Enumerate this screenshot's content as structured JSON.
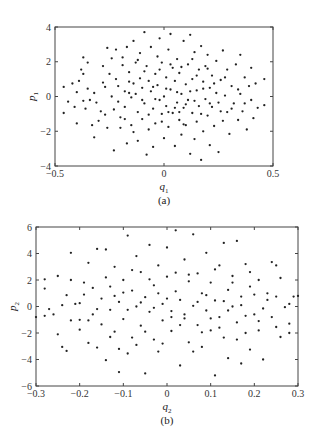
{
  "chart_data": [
    {
      "type": "scatter",
      "panel": "(a)",
      "caption": "(a)",
      "xlabel": "q",
      "xlabel_sub": "1",
      "ylabel": "p",
      "ylabel_sub": "1",
      "xlim": [
        -0.5,
        0.5
      ],
      "ylim": [
        -4,
        4
      ],
      "xticks": [
        -0.5,
        0,
        0.5
      ],
      "xtick_labels": [
        "-0.5",
        "0",
        "0.5"
      ],
      "yticks": [
        -4,
        -2,
        0,
        2,
        4
      ],
      "ytick_labels": [
        "-4",
        "-2",
        "0",
        "2",
        "4"
      ],
      "grid": false,
      "frame": {
        "left": 55,
        "top": 27,
        "right": 273,
        "bottom": 166
      },
      "points": [
        [
          -0.46,
          0.55
        ],
        [
          -0.46,
          -0.95
        ],
        [
          -0.42,
          0.75
        ],
        [
          -0.41,
          -0.6
        ],
        [
          -0.4,
          0.25
        ],
        [
          -0.4,
          -1.55
        ],
        [
          -0.38,
          1.55
        ],
        [
          -0.37,
          2.25
        ],
        [
          -0.37,
          1.3
        ],
        [
          -0.37,
          -0.25
        ],
        [
          -0.36,
          -0.7
        ],
        [
          -0.35,
          1.95
        ],
        [
          -0.34,
          -0.2
        ],
        [
          -0.33,
          -1.65
        ],
        [
          -0.32,
          0.2
        ],
        [
          -0.32,
          -2.35
        ],
        [
          -0.3,
          -1.4
        ],
        [
          -0.29,
          -0.85
        ],
        [
          -0.28,
          1.75
        ],
        [
          -0.28,
          0.8
        ],
        [
          -0.27,
          0.55
        ],
        [
          -0.26,
          -1.8
        ],
        [
          -0.26,
          2.8
        ],
        [
          -0.25,
          1.3
        ],
        [
          -0.24,
          0.0
        ],
        [
          -0.23,
          -3.1
        ],
        [
          -0.23,
          -0.75
        ],
        [
          -0.22,
          2.7
        ],
        [
          -0.22,
          1.0
        ],
        [
          -0.21,
          0.6
        ],
        [
          -0.21,
          -0.3
        ],
        [
          -0.2,
          -1.2
        ],
        [
          -0.19,
          2.25
        ],
        [
          -0.19,
          1.8
        ],
        [
          -0.18,
          0.3
        ],
        [
          -0.18,
          -0.6
        ],
        [
          -0.17,
          -2.7
        ],
        [
          -0.17,
          2.85
        ],
        [
          -0.16,
          1.4
        ],
        [
          -0.16,
          0.85
        ],
        [
          -0.15,
          -1.65
        ],
        [
          -0.15,
          -0.05
        ],
        [
          -0.14,
          3.2
        ],
        [
          -0.14,
          -2.05
        ],
        [
          -0.13,
          1.95
        ],
        [
          -0.13,
          0.15
        ],
        [
          -0.12,
          -0.9
        ],
        [
          -0.12,
          -2.55
        ],
        [
          -0.11,
          2.5
        ],
        [
          -0.11,
          1.05
        ],
        [
          -0.1,
          0.5
        ],
        [
          -0.1,
          -1.3
        ],
        [
          -0.09,
          3.7
        ],
        [
          -0.09,
          -0.4
        ],
        [
          -0.08,
          -3.35
        ],
        [
          -0.08,
          1.75
        ],
        [
          -0.07,
          0.9
        ],
        [
          -0.07,
          -1.9
        ],
        [
          -0.06,
          2.85
        ],
        [
          -0.06,
          0.3
        ],
        [
          -0.05,
          -0.7
        ],
        [
          -0.05,
          -2.9
        ],
        [
          -0.04,
          1.3
        ],
        [
          -0.04,
          -1.55
        ],
        [
          -0.03,
          2.3
        ],
        [
          -0.03,
          0.65
        ],
        [
          -0.02,
          3.35
        ],
        [
          -0.02,
          -0.2
        ],
        [
          -0.01,
          -1.0
        ],
        [
          -0.01,
          1.95
        ],
        [
          0.0,
          0.0
        ],
        [
          0.0,
          -2.4
        ],
        [
          0.01,
          1.1
        ],
        [
          0.01,
          -0.55
        ],
        [
          0.02,
          2.7
        ],
        [
          0.02,
          -1.75
        ],
        [
          0.03,
          3.6
        ],
        [
          0.03,
          0.4
        ],
        [
          0.04,
          -0.95
        ],
        [
          0.04,
          1.65
        ],
        [
          0.05,
          -2.85
        ],
        [
          0.05,
          0.9
        ],
        [
          0.06,
          -0.35
        ],
        [
          0.06,
          2.15
        ],
        [
          0.07,
          -1.35
        ],
        [
          0.07,
          1.35
        ],
        [
          0.08,
          0.15
        ],
        [
          0.08,
          -2.2
        ],
        [
          0.09,
          3.2
        ],
        [
          0.09,
          -0.65
        ],
        [
          0.1,
          0.7
        ],
        [
          0.1,
          -1.65
        ],
        [
          0.11,
          1.85
        ],
        [
          0.11,
          -0.2
        ],
        [
          0.12,
          3.55
        ],
        [
          0.12,
          -3.3
        ],
        [
          0.13,
          -0.95
        ],
        [
          0.13,
          1.0
        ],
        [
          0.14,
          2.55
        ],
        [
          0.14,
          -2.45
        ],
        [
          0.15,
          0.35
        ],
        [
          0.15,
          -1.45
        ],
        [
          0.16,
          1.55
        ],
        [
          0.16,
          -0.55
        ],
        [
          0.17,
          2.9
        ],
        [
          0.17,
          -3.65
        ],
        [
          0.18,
          0.85
        ],
        [
          0.18,
          -2.0
        ],
        [
          0.19,
          -0.15
        ],
        [
          0.19,
          1.75
        ],
        [
          0.2,
          -1.1
        ],
        [
          0.2,
          2.4
        ],
        [
          0.21,
          0.5
        ],
        [
          0.21,
          -2.8
        ],
        [
          0.22,
          -0.6
        ],
        [
          0.22,
          1.2
        ],
        [
          0.23,
          -1.7
        ],
        [
          0.24,
          0.2
        ],
        [
          0.24,
          2.05
        ],
        [
          0.25,
          -0.35
        ],
        [
          0.25,
          -3.2
        ],
        [
          0.26,
          0.95
        ],
        [
          0.27,
          -1.4
        ],
        [
          0.27,
          2.65
        ],
        [
          0.28,
          0.05
        ],
        [
          0.29,
          -0.9
        ],
        [
          0.29,
          1.55
        ],
        [
          0.3,
          -2.15
        ],
        [
          0.31,
          0.6
        ],
        [
          0.32,
          -0.4
        ],
        [
          0.33,
          1.85
        ],
        [
          0.34,
          -1.35
        ],
        [
          0.35,
          2.4
        ],
        [
          0.35,
          0.15
        ],
        [
          0.36,
          -0.85
        ],
        [
          0.37,
          1.1
        ],
        [
          0.38,
          -1.9
        ],
        [
          0.39,
          0.6
        ],
        [
          0.4,
          -0.2
        ],
        [
          0.4,
          1.65
        ],
        [
          0.41,
          -1.25
        ],
        [
          0.42,
          0.75
        ],
        [
          0.43,
          -0.65
        ],
        [
          0.46,
          1.0
        ],
        [
          0.46,
          -0.5
        ],
        [
          -0.44,
          -0.3
        ],
        [
          -0.39,
          0.9
        ],
        [
          -0.35,
          0.45
        ],
        [
          -0.31,
          -0.35
        ],
        [
          -0.27,
          -1.05
        ],
        [
          -0.24,
          2.2
        ],
        [
          -0.2,
          -1.8
        ],
        [
          -0.18,
          -1.3
        ],
        [
          -0.16,
          0.2
        ],
        [
          -0.14,
          0.75
        ],
        [
          -0.12,
          2.1
        ],
        [
          -0.1,
          -0.2
        ],
        [
          -0.09,
          1.45
        ],
        [
          -0.07,
          -1.05
        ],
        [
          -0.05,
          0.55
        ],
        [
          -0.04,
          -0.15
        ],
        [
          -0.02,
          1.55
        ],
        [
          -0.01,
          -1.45
        ],
        [
          0.01,
          0.45
        ],
        [
          0.02,
          -0.9
        ],
        [
          0.03,
          1.85
        ],
        [
          0.05,
          -0.65
        ],
        [
          0.06,
          0.25
        ],
        [
          0.07,
          -0.9
        ],
        [
          0.08,
          1.7
        ],
        [
          0.09,
          -1.6
        ],
        [
          0.1,
          -0.45
        ],
        [
          0.12,
          0.3
        ],
        [
          0.13,
          2.15
        ],
        [
          0.14,
          -0.25
        ],
        [
          0.15,
          1.2
        ],
        [
          0.17,
          -1.0
        ],
        [
          0.18,
          0.45
        ],
        [
          0.2,
          1.6
        ],
        [
          0.21,
          -0.4
        ],
        [
          0.23,
          0.75
        ],
        [
          0.26,
          -0.85
        ],
        [
          0.28,
          1.1
        ],
        [
          0.31,
          -0.7
        ],
        [
          0.34,
          0.4
        ],
        [
          0.37,
          -0.4
        ]
      ]
    },
    {
      "type": "scatter",
      "panel": "(b)",
      "caption": "(b)",
      "xlabel": "q",
      "xlabel_sub": "2",
      "ylabel": "p",
      "ylabel_sub": "2",
      "xlim": [
        -0.3,
        0.3
      ],
      "ylim": [
        -6,
        6
      ],
      "xticks": [
        -0.3,
        -0.2,
        -0.1,
        0,
        0.1,
        0.2,
        0.3
      ],
      "xtick_labels": [
        "-0.3",
        "-0.2",
        "-0.1",
        "0",
        "0.1",
        "0.2",
        "0.3"
      ],
      "yticks": [
        -6,
        -4,
        -2,
        0,
        2,
        4,
        6
      ],
      "ytick_labels": [
        "-6",
        "-4",
        "-2",
        "0",
        "2",
        "4",
        "6"
      ],
      "grid": false,
      "frame": {
        "left": 36,
        "top": 227,
        "right": 298,
        "bottom": 386
      },
      "points": [
        [
          -0.3,
          -0.8
        ],
        [
          -0.28,
          2.05
        ],
        [
          -0.28,
          1.35
        ],
        [
          -0.28,
          -0.7
        ],
        [
          -0.27,
          -0.2
        ],
        [
          -0.25,
          2.3
        ],
        [
          -0.25,
          -2.1
        ],
        [
          -0.24,
          0.1
        ],
        [
          -0.24,
          -3.05
        ],
        [
          -0.23,
          0.85
        ],
        [
          -0.23,
          -3.35
        ],
        [
          -0.22,
          4.05
        ],
        [
          -0.22,
          2.0
        ],
        [
          -0.21,
          0.2
        ],
        [
          -0.2,
          -1.75
        ],
        [
          -0.2,
          -1.0
        ],
        [
          -0.19,
          1.8
        ],
        [
          -0.19,
          0.9
        ],
        [
          -0.18,
          3.3
        ],
        [
          -0.18,
          -2.75
        ],
        [
          -0.17,
          1.4
        ],
        [
          -0.17,
          -0.6
        ],
        [
          -0.16,
          4.35
        ],
        [
          -0.16,
          -3.1
        ],
        [
          -0.15,
          0.6
        ],
        [
          -0.15,
          -1.35
        ],
        [
          -0.14,
          4.3
        ],
        [
          -0.14,
          -4.05
        ],
        [
          -0.13,
          1.5
        ],
        [
          -0.13,
          -0.25
        ],
        [
          -0.12,
          3.0
        ],
        [
          -0.12,
          -1.9
        ],
        [
          -0.11,
          0.35
        ],
        [
          -0.11,
          -4.95
        ],
        [
          -0.1,
          2.0
        ],
        [
          -0.1,
          -0.95
        ],
        [
          -0.09,
          5.35
        ],
        [
          -0.09,
          -3.55
        ],
        [
          -0.08,
          1.2
        ],
        [
          -0.08,
          -2.35
        ],
        [
          -0.07,
          3.8
        ],
        [
          -0.07,
          0.0
        ],
        [
          -0.06,
          -1.45
        ],
        [
          -0.06,
          2.6
        ],
        [
          -0.05,
          -5.05
        ],
        [
          -0.05,
          0.7
        ],
        [
          -0.04,
          -0.4
        ],
        [
          -0.04,
          4.65
        ],
        [
          -0.03,
          1.6
        ],
        [
          -0.03,
          -2.5
        ],
        [
          -0.02,
          3.1
        ],
        [
          -0.02,
          -3.4
        ],
        [
          -0.01,
          0.2
        ],
        [
          -0.01,
          -1.05
        ],
        [
          0.0,
          2.25
        ],
        [
          0.0,
          4.45
        ],
        [
          0.01,
          -0.35
        ],
        [
          0.01,
          -1.85
        ],
        [
          0.02,
          1.15
        ],
        [
          0.02,
          5.75
        ],
        [
          0.03,
          -4.45
        ],
        [
          0.03,
          0.5
        ],
        [
          0.04,
          3.55
        ],
        [
          0.04,
          -0.9
        ],
        [
          0.05,
          1.9
        ],
        [
          0.05,
          -2.7
        ],
        [
          0.06,
          5.45
        ],
        [
          0.06,
          0.05
        ],
        [
          0.07,
          -1.4
        ],
        [
          0.07,
          2.5
        ],
        [
          0.08,
          -3.05
        ],
        [
          0.08,
          1.0
        ],
        [
          0.09,
          -0.3
        ],
        [
          0.09,
          4.05
        ],
        [
          0.1,
          -1.8
        ],
        [
          0.1,
          1.8
        ],
        [
          0.11,
          -5.2
        ],
        [
          0.11,
          0.45
        ],
        [
          0.12,
          3.1
        ],
        [
          0.12,
          -0.8
        ],
        [
          0.13,
          4.8
        ],
        [
          0.13,
          -2.35
        ],
        [
          0.14,
          1.25
        ],
        [
          0.14,
          -3.9
        ],
        [
          0.15,
          0.0
        ],
        [
          0.15,
          2.3
        ],
        [
          0.16,
          -1.2
        ],
        [
          0.16,
          4.95
        ],
        [
          0.17,
          0.75
        ],
        [
          0.17,
          -4.3
        ],
        [
          0.18,
          -2.0
        ],
        [
          0.18,
          3.2
        ],
        [
          0.19,
          1.5
        ],
        [
          0.19,
          -3.25
        ],
        [
          0.2,
          -0.6
        ],
        [
          0.2,
          0.9
        ],
        [
          0.21,
          2.0
        ],
        [
          0.21,
          -1.8
        ],
        [
          0.22,
          -0.15
        ],
        [
          0.22,
          -4.0
        ],
        [
          0.23,
          1.0
        ],
        [
          0.24,
          3.35
        ],
        [
          0.24,
          -0.8
        ],
        [
          0.25,
          3.1
        ],
        [
          0.25,
          0.75
        ],
        [
          0.26,
          -2.3
        ],
        [
          0.26,
          2.15
        ],
        [
          0.27,
          -0.05
        ],
        [
          0.28,
          0.2
        ],
        [
          0.28,
          -1.3
        ],
        [
          0.28,
          -2.0
        ],
        [
          0.29,
          0.75
        ],
        [
          0.3,
          0.8
        ],
        [
          -0.26,
          -0.6
        ],
        [
          -0.22,
          -1.05
        ],
        [
          -0.2,
          0.25
        ],
        [
          -0.18,
          -1.05
        ],
        [
          -0.16,
          -0.2
        ],
        [
          -0.14,
          2.2
        ],
        [
          -0.13,
          -2.3
        ],
        [
          -0.12,
          0.8
        ],
        [
          -0.11,
          -3.2
        ],
        [
          -0.1,
          1.05
        ],
        [
          -0.09,
          -0.25
        ],
        [
          -0.08,
          2.75
        ],
        [
          -0.07,
          -2.9
        ],
        [
          -0.06,
          0.3
        ],
        [
          -0.05,
          -1.9
        ],
        [
          -0.04,
          2.05
        ],
        [
          -0.03,
          -0.1
        ],
        [
          -0.02,
          1.0
        ],
        [
          -0.01,
          -2.8
        ],
        [
          0.0,
          0.6
        ],
        [
          0.01,
          -0.8
        ],
        [
          0.02,
          2.55
        ],
        [
          0.03,
          -1.4
        ],
        [
          0.04,
          -0.6
        ],
        [
          0.05,
          2.4
        ],
        [
          0.06,
          -3.4
        ],
        [
          0.07,
          0.35
        ],
        [
          0.08,
          -1.95
        ],
        [
          0.09,
          0.85
        ],
        [
          0.1,
          -0.9
        ],
        [
          0.11,
          2.8
        ],
        [
          0.12,
          -1.6
        ],
        [
          0.13,
          0.4
        ],
        [
          0.14,
          -0.3
        ],
        [
          0.15,
          1.8
        ],
        [
          0.16,
          -2.5
        ],
        [
          0.17,
          0.1
        ],
        [
          0.18,
          -0.7
        ],
        [
          0.19,
          2.6
        ],
        [
          0.21,
          -1.1
        ],
        [
          0.23,
          0.5
        ],
        [
          0.25,
          -1.55
        ]
      ]
    }
  ]
}
